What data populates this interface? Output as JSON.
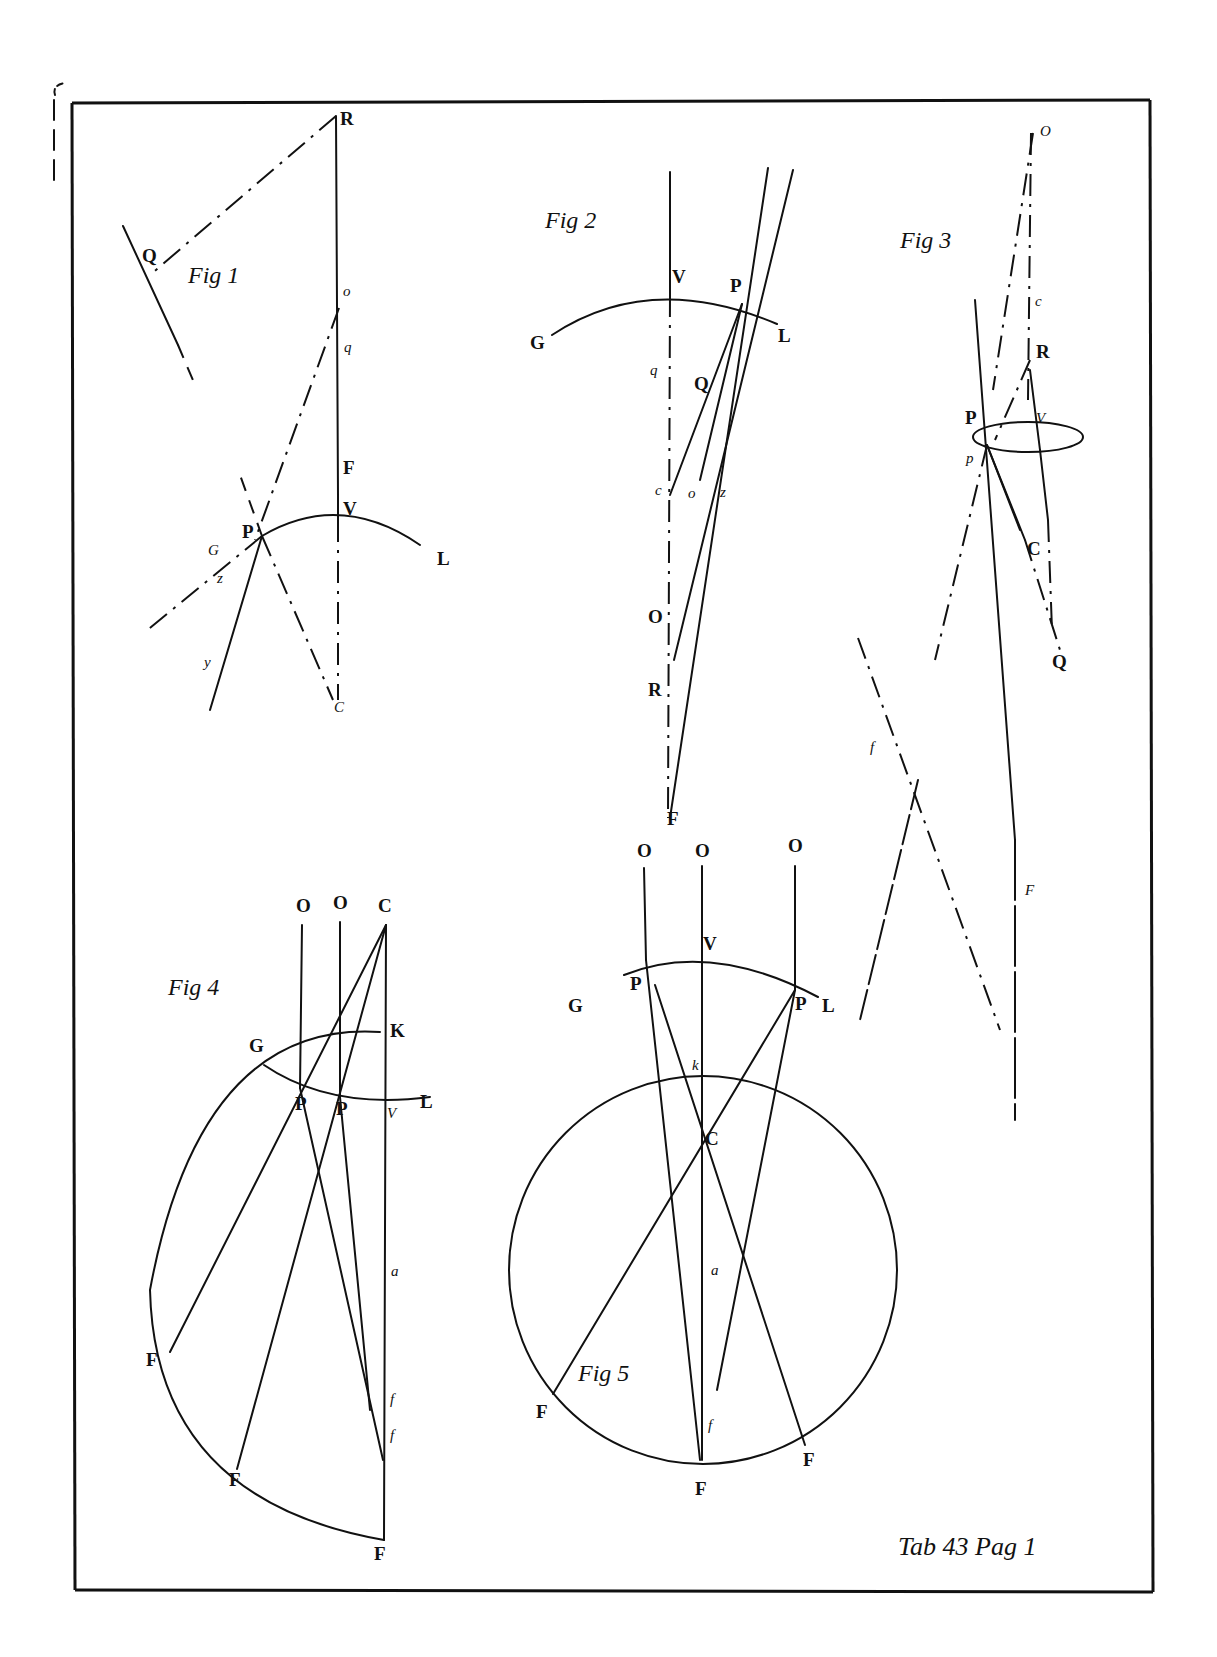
{
  "plate": {
    "caption": "Tab 43 Pag 1",
    "ink_color": "#111111",
    "paper_color": "#ffffff"
  },
  "figures": [
    {
      "id": "fig1",
      "title": "Fig 1",
      "labels": [
        "R",
        "Q",
        "O",
        "q",
        "F",
        "V",
        "P",
        "G",
        "z",
        "y",
        "L",
        "C"
      ]
    },
    {
      "id": "fig2",
      "title": "Fig 2",
      "labels": [
        "V",
        "P",
        "G",
        "L",
        "q",
        "Q",
        "c",
        "o",
        "z",
        "O",
        "R",
        "F"
      ]
    },
    {
      "id": "fig3",
      "title": "Fig 3",
      "labels": [
        "O",
        "c",
        "R",
        "P",
        "V",
        "p",
        "C",
        "Q",
        "f",
        "F"
      ]
    },
    {
      "id": "fig4",
      "title": "Fig 4",
      "labels": [
        "O",
        "O",
        "C",
        "K",
        "G",
        "P",
        "P",
        "V",
        "L",
        "a",
        "F",
        "F",
        "F",
        "f",
        "f"
      ]
    },
    {
      "id": "fig5",
      "title": "Fig 5",
      "labels": [
        "O",
        "O",
        "O",
        "V",
        "G",
        "P",
        "P",
        "L",
        "k",
        "C",
        "a",
        "F",
        "F",
        "F",
        "f"
      ]
    }
  ]
}
